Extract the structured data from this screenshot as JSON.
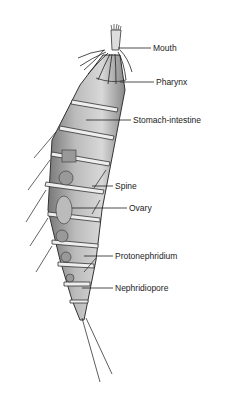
{
  "diagram": {
    "labels": [
      {
        "id": "mouth",
        "text": "Mouth",
        "x": 153,
        "y": 44
      },
      {
        "id": "pharynx",
        "text": "Pharynx",
        "x": 156,
        "y": 77
      },
      {
        "id": "stomach",
        "text": "Stomach-intestine",
        "x": 133,
        "y": 114
      },
      {
        "id": "spine",
        "text": "Spine",
        "x": 115,
        "y": 182
      },
      {
        "id": "ovary",
        "text": "Ovary",
        "x": 129,
        "y": 203
      },
      {
        "id": "protonephridium",
        "text": "Protonephridium",
        "x": 115,
        "y": 252
      },
      {
        "id": "nephridiopore",
        "text": "Nephridiopore",
        "x": 115,
        "y": 282
      }
    ]
  }
}
